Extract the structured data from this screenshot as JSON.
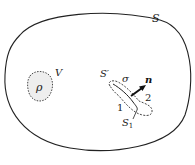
{
  "diagram": {
    "type": "surface-charge-region-schematic",
    "outer_surface": {
      "label": "S"
    },
    "volume_region": {
      "label": "V",
      "density_label": "ρ"
    },
    "inner_surface": {
      "label": "S′",
      "loop_label": "σ",
      "normal_label": "n",
      "side_labels": [
        "1",
        "2"
      ],
      "sub_surface_label": "S",
      "sub_surface_subscript": "1"
    },
    "colors": {
      "stroke": "#222222",
      "region_fill": "#eeeeee",
      "background": "#ffffff"
    }
  }
}
